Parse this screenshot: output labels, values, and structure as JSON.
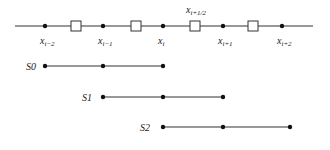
{
  "diagram": {
    "grid_line": {
      "x1": 15,
      "x2": 313,
      "y": 26
    },
    "nodes": [
      {
        "x": 45,
        "label": "x",
        "sub": "i−2"
      },
      {
        "x": 103,
        "label": "x",
        "sub": "i−1"
      },
      {
        "x": 163,
        "label": "x",
        "sub": "i"
      },
      {
        "x": 223,
        "label": "x",
        "sub": "i+1"
      },
      {
        "x": 282,
        "label": "x",
        "sub": "i+2"
      }
    ],
    "faces": [
      {
        "x": 76
      },
      {
        "x": 136
      },
      {
        "x": 195,
        "label": "x",
        "sub": "i+1/2"
      },
      {
        "x": 253
      }
    ],
    "stencils": [
      {
        "name": "S0",
        "y": 66,
        "label_x": 26,
        "xs": [
          45,
          103,
          163
        ]
      },
      {
        "name": "S1",
        "y": 97,
        "label_x": 82,
        "xs": [
          103,
          163,
          223
        ]
      },
      {
        "name": "S2",
        "y": 127,
        "label_x": 140,
        "xs": [
          163,
          223,
          290
        ]
      }
    ],
    "colors": {
      "line": "#333333",
      "dot": "#111111",
      "box": "#333333",
      "text": "#222222"
    }
  }
}
